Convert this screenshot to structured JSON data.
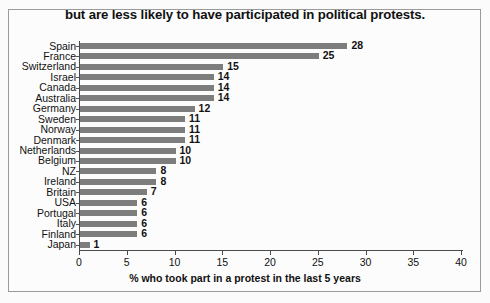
{
  "chart_data": {
    "type": "bar",
    "orientation": "horizontal",
    "title": "but are less likely to have participated in political protests.",
    "xlabel": "% who took part in a protest in the last 5 years",
    "ylabel": "",
    "xlim": [
      0,
      40
    ],
    "xticks": [
      0,
      5,
      10,
      15,
      20,
      25,
      30,
      35,
      40
    ],
    "grid": false,
    "legend": false,
    "bar_color": "#7d7d7d",
    "categories": [
      "Spain",
      "France",
      "Switzerland",
      "Israel",
      "Canada",
      "Australia",
      "Germany",
      "Sweden",
      "Norway",
      "Denmark",
      "Netherlands",
      "Belgium",
      "NZ",
      "Ireland",
      "Britain",
      "USA",
      "Portugal",
      "Italy",
      "Finland",
      "Japan"
    ],
    "values": [
      28,
      25,
      15,
      14,
      14,
      14,
      12,
      11,
      11,
      11,
      10,
      10,
      8,
      8,
      7,
      6,
      6,
      6,
      6,
      1
    ],
    "value_labels": [
      "28",
      "25",
      "15",
      "14",
      "14",
      "14",
      "12",
      "11",
      "11",
      "11",
      "10",
      "10",
      "8",
      "8",
      "7",
      "6",
      "6",
      "6",
      "6",
      "1"
    ]
  }
}
